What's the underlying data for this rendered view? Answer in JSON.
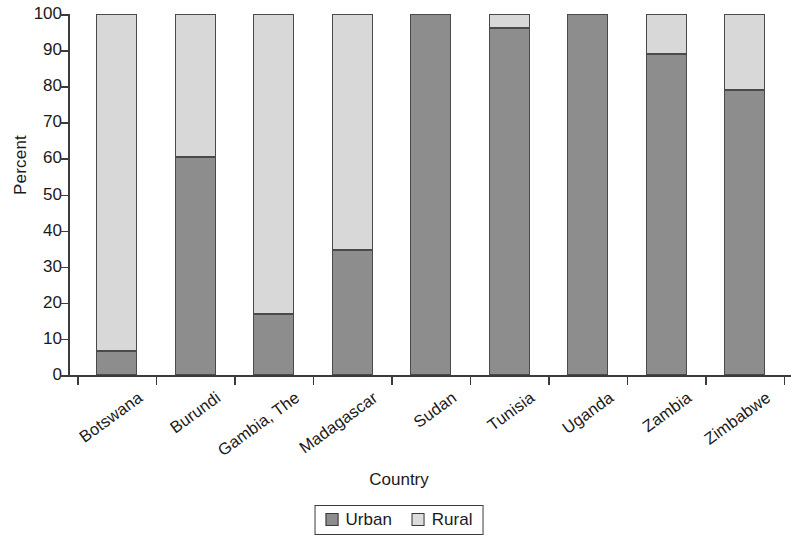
{
  "chart_data": {
    "type": "bar",
    "subtype": "stacked-bar-100pct",
    "title": "",
    "xlabel": "Country",
    "ylabel": "Percent",
    "ylim": [
      0,
      100
    ],
    "yticks": [
      0,
      10,
      20,
      30,
      40,
      50,
      60,
      70,
      80,
      90,
      100
    ],
    "ytick_labels": [
      "0",
      "10",
      "20",
      "30",
      "40",
      "50",
      "60",
      "70",
      "80",
      "90",
      "100"
    ],
    "grid": false,
    "legend_position": "bottom-center",
    "categories": [
      "Botswana",
      "Burundi",
      "Gambia, The",
      "Madagascar",
      "Sudan",
      "Tunisia",
      "Uganda",
      "Zambia",
      "Zimbabwe"
    ],
    "series": [
      {
        "name": "Urban",
        "color": "#8d8d8d",
        "values": [
          6.6,
          60.5,
          17.0,
          34.5,
          100.0,
          96.0,
          100.0,
          89.0,
          79.0
        ]
      },
      {
        "name": "Rural",
        "color": "#d8d8d8",
        "values": [
          93.4,
          39.5,
          83.0,
          65.5,
          0.0,
          4.0,
          0.0,
          11.0,
          21.0
        ]
      }
    ]
  },
  "legend": {
    "entries": [
      {
        "label": "Urban"
      },
      {
        "label": "Rural"
      }
    ]
  },
  "axes": {
    "x_title": "Country",
    "y_title": "Percent"
  },
  "colors": {
    "urban": "#8d8d8d",
    "rural": "#d8d8d8",
    "axis": "#3b3b3b",
    "bar_outline": "#4a4a4a",
    "background": "#ffffff"
  }
}
